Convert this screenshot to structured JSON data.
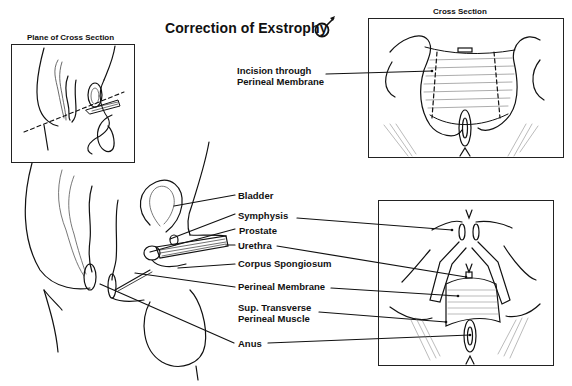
{
  "title": "Correction of Exstrophy",
  "title_symbol": "male-symbol",
  "insets": {
    "plane": {
      "caption": "Plane of Cross Section"
    },
    "cross_section": {
      "caption": "Cross Section"
    },
    "perineal_view": {
      "caption": ""
    }
  },
  "labels": {
    "incision": [
      "Incision through",
      "Perineal Membrane"
    ],
    "bladder": "Bladder",
    "symphysis": "Symphysis",
    "prostate": "Prostate",
    "urethra": "Urethra",
    "corpus_spongiosum": "Corpus Spongiosum",
    "perineal_membrane": "Perineal Membrane",
    "sup_transverse": [
      "Sup. Transverse",
      "Perineal Muscle"
    ],
    "anus": "Anus"
  },
  "colors": {
    "ink": "#111111",
    "background": "#ffffff"
  }
}
